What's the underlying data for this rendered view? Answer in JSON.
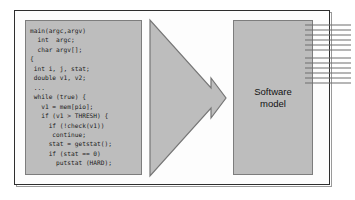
{
  "figure": {
    "background_color": "#ffffff",
    "frame_color": "#2e2e2e",
    "block_fill": "#bdbdbd",
    "block_stroke": "#7d7d7d",
    "arrow_fill": "#bdbdbd",
    "arrow_stroke": "#767676",
    "bus_color": "#6e6e6e"
  },
  "code_panel": {
    "name": "source-code-listing",
    "language": "C",
    "code": "main(argc,argv)\n  int  argc;\n  char argv[];\n{\n int i, j, stat;\n double v1, v2;\n ...\n while (true) {\n   v1 = mem[pio];\n   if (v1 > THRESH) {\n     if (!check(v1))\n      continue;\n     stat = getstat();\n     if (stat == 0)\n       putstat (HARD);\n     ...",
    "lines": [
      "main(argc,argv)",
      "  int  argc;",
      "  char argv[];",
      "{",
      " int i, j, stat;",
      " double v1, v2;",
      " ...",
      " while (true) {",
      "   v1 = mem[pio];",
      "   if (v1 > THRESH) {",
      "     if (!check(v1))",
      "      continue;",
      "     stat = getstat();",
      "     if (stat == 0)",
      "       putstat (HARD);",
      "     ..."
    ]
  },
  "arrow": {
    "name": "transformation-arrow",
    "direction": "right",
    "label": ""
  },
  "model_block": {
    "name": "software-model-block",
    "label": "Software\nmodel"
  },
  "output_bus": {
    "name": "output-signal-bus",
    "groups": 2,
    "lines_per_group": 6,
    "label": ""
  }
}
